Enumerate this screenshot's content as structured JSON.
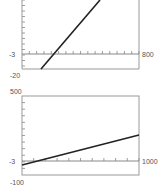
{
  "chart_data": [
    {
      "type": "line",
      "title": "",
      "window": {
        "xmin": -3,
        "xmax": 800,
        "ymin": -20,
        "ymax": null
      },
      "labels": {
        "x_min": "-3",
        "x_max": "800",
        "y_min": "-20"
      },
      "x_tick_count": 16,
      "grid": false,
      "series": [
        {
          "name": "line",
          "points_px": [
            [
              41,
              69
            ],
            [
              100,
              0
            ]
          ],
          "description": "steep increasing line crossing x-axis near x≈100"
        }
      ]
    },
    {
      "type": "line",
      "title": "",
      "window": {
        "xmin": -3,
        "xmax": 1000,
        "ymin": -100,
        "ymax": 500
      },
      "labels": {
        "x_min": "-3",
        "x_max": "1000",
        "y_min": "-100",
        "y_max": "500"
      },
      "x_tick_count": 10,
      "grid": false,
      "series": [
        {
          "name": "line",
          "points_px": [
            [
              22,
              165
            ],
            [
              139,
              135
            ]
          ],
          "description": "gently increasing line from about -50 at left to about 200 at right"
        }
      ]
    }
  ],
  "plot1": {
    "xmin_label": "-3",
    "xmax_label": "800",
    "ymin_label": "-20"
  },
  "plot2": {
    "xmin_label": "-3",
    "xmax_label": "1000",
    "ymin_label": "-100",
    "ymax_label": "500"
  },
  "colors": {
    "axis": "#888888",
    "line": "#222222",
    "text": "#555555"
  }
}
